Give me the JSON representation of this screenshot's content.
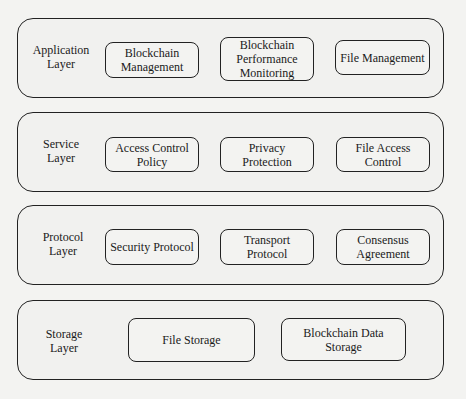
{
  "layers": [
    {
      "label": "Application Layer",
      "components": [
        {
          "label": "Blockchain Management"
        },
        {
          "label": "Blockchain Performance Monitoring"
        },
        {
          "label": "File Management"
        }
      ]
    },
    {
      "label": "Service Layer",
      "components": [
        {
          "label": "Access Control Policy"
        },
        {
          "label": "Privacy Protection"
        },
        {
          "label": "File Access Control"
        }
      ]
    },
    {
      "label": "Protocol Layer",
      "components": [
        {
          "label": "Security Protocol"
        },
        {
          "label": "Transport Protocol"
        },
        {
          "label": "Consensus Agreement"
        }
      ]
    },
    {
      "label": "Storage Layer",
      "components": [
        {
          "label": "File Storage"
        },
        {
          "label": "Blockchain Data Storage"
        }
      ]
    }
  ]
}
